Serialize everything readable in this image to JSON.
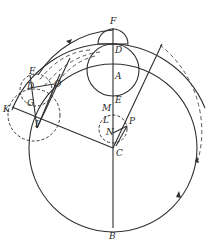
{
  "diagram": {
    "type": "geometric epicycle diagram",
    "labels": {
      "F_top": "F",
      "D_top": "D",
      "A": "A",
      "E": "E",
      "M": "M",
      "L": "L",
      "P": "P",
      "N": "N",
      "C": "C",
      "B": "B",
      "F_left": "F",
      "D_left": "D",
      "O": "O",
      "G": "G",
      "K": "K",
      "I": "I"
    },
    "colors": {
      "stroke": "#2f2f2f",
      "background": "#ffffff"
    }
  }
}
